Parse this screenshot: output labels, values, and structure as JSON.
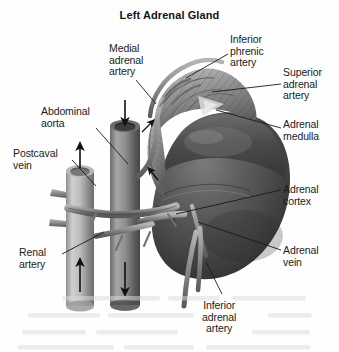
{
  "figure": {
    "title": "Left Adrenal Gland",
    "type": "anatomical-illustration",
    "style": "grayscale halftone scan",
    "background_color": "#fefefe",
    "text_color": "#1b1b1b"
  },
  "labels": {
    "medial_adrenal_artery": "Medial\nadrenal\nartery",
    "inferior_phrenic_artery": "Inferior\nphrenic\nartery",
    "superior_adrenal_artery": "Superior\nadrenal\nartery",
    "adrenal_medulla": "Adrenal\nmedulla",
    "adrenal_cortex": "Adrenal\ncortex",
    "adrenal_vein": "Adrenal\nvein",
    "abdominal_aorta": "Abdominal\naorta",
    "postcaval_vein": "Postcaval\nvein",
    "renal_artery": "Renal\nartery",
    "inferior_adrenal_artery": "Inferior\nadrenal\nartery"
  },
  "structures": {
    "adrenal_gland": "striated adrenal gland cap",
    "kidney": "smooth kidney body",
    "aorta_vessel": "cut abdominal aorta cylinder",
    "postcaval_vessel": "cut postcaval vein cylinder",
    "flow_arrows": [
      {
        "vessel": "abdominal aorta",
        "direction": "down"
      },
      {
        "vessel": "postcaval vein",
        "direction": "up"
      }
    ]
  },
  "colors": {
    "kidney_dark": "#3a3a3a",
    "kidney_mid": "#5c5c5c",
    "kidney_light": "#8d8d8d",
    "gland_dark": "#555555",
    "gland_light": "#b4b4b4",
    "vessel_light": "#c9c9c9",
    "vessel_dark": "#6e6e6e",
    "leader_line": "#1a1a1a"
  }
}
